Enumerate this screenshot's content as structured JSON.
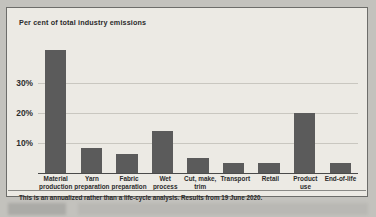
{
  "figure": {
    "axis_title": "Per cent of total industry emissions",
    "footnote": "This is an annualized rather than a life-cycle analysis. Results from 19 June 2020."
  },
  "colors": {
    "bar": "#5b5b5b",
    "panel_background": "#eceae4",
    "border": "#6d6d6a",
    "gridline": "#c9c7c0",
    "axis": "#4a4a4a",
    "text": "#2b2b2b"
  },
  "chart_data": {
    "type": "bar",
    "title": "Per cent of total industry emissions",
    "xlabel": "",
    "ylabel": "Per cent of total industry emissions",
    "ylim": [
      0,
      45
    ],
    "grid": true,
    "legend": null,
    "ytick_labels": [
      "10%",
      "20%",
      "30%"
    ],
    "ytick_values": [
      10,
      20,
      30
    ],
    "categories": [
      "Material production",
      "Yarn preparation",
      "Fabric preparation",
      "Wet process",
      "Cut, make, trim",
      "Transport",
      "Retail",
      "Product use",
      "End-of-life"
    ],
    "values": [
      41,
      8.5,
      6.5,
      14,
      5,
      3.5,
      3.5,
      20,
      3.5
    ],
    "annotation": "This is an annualized rather than a life-cycle analysis. Results from 19 June 2020."
  }
}
